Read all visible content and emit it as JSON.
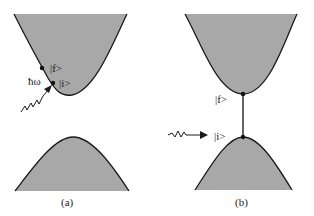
{
  "figure": {
    "panels": [
      {
        "id": "a",
        "caption": "(a)",
        "description": "Indirect transition: photon absorbed at state |i> on conduction band, final state |f> on same band",
        "labels": {
          "final_state": "|f>",
          "initial_state": "|i>",
          "photon_energy": "ħω"
        }
      },
      {
        "id": "b",
        "caption": "(b)",
        "description": "Direct (vertical) interband transition from |i> at top of valence band to |f> at bottom of conduction band",
        "labels": {
          "final_state": "|f>",
          "initial_state": "|i>"
        }
      }
    ],
    "colors": {
      "band_fill": "#a8a8a8",
      "edge": "#1a1a1a"
    }
  }
}
